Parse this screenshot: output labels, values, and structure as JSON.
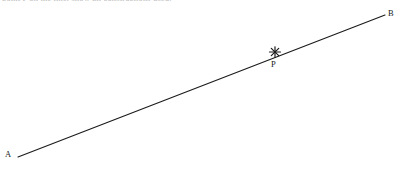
{
  "figure": {
    "width": 402,
    "height": 182,
    "background_color": "#ffffff",
    "stroke_color": "#1a1a1a",
    "text_color": "#1a1a1a"
  },
  "caption": {
    "clipped_text": "point P on the line, show all constructions used.",
    "color": "#b9b9b9"
  },
  "segment": {
    "name": "AB",
    "x1": 18,
    "y1": 157,
    "x2": 385,
    "y2": 15,
    "stroke_width": 1
  },
  "labels": {
    "a": "A",
    "b": "B",
    "p": "P"
  },
  "marker": {
    "glyph": "star-marker",
    "cx": 275,
    "cy": 52
  }
}
